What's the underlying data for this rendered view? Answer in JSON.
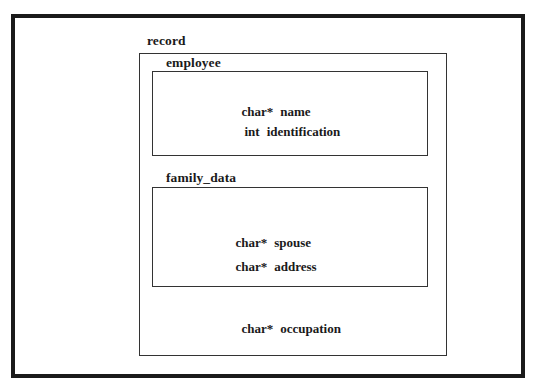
{
  "diagram": {
    "title": "record",
    "record": {
      "label": "record",
      "groups": [
        {
          "label": "employee",
          "fields": [
            {
              "type": "char*",
              "name": "name"
            },
            {
              "type": "int",
              "name": "identification"
            }
          ]
        },
        {
          "label": "family_data",
          "fields": [
            {
              "type": "char*",
              "name": "spouse"
            },
            {
              "type": "char*",
              "name": "address"
            }
          ]
        }
      ],
      "fields": [
        {
          "type": "char*",
          "name": "occupation"
        }
      ]
    },
    "colors": {
      "background": "#ffffff",
      "stroke": "#1a1a1a",
      "text": "#1a1a1a"
    }
  }
}
